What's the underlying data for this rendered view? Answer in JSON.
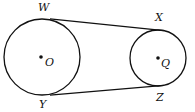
{
  "diagram": {
    "type": "geometry",
    "circles": [
      {
        "id": "circle-o",
        "center_label": "O",
        "cx": 42,
        "cy": 57,
        "r": 38
      },
      {
        "id": "circle-q",
        "center_label": "Q",
        "cx": 158,
        "cy": 58,
        "r": 28
      }
    ],
    "tangents": [
      {
        "id": "tangent-wx",
        "from": "W",
        "to": "X",
        "x1": 50,
        "y1": 18.8,
        "x2": 164,
        "y2": 30.6
      },
      {
        "id": "tangent-yz",
        "from": "Y",
        "to": "Z",
        "x1": 50,
        "y1": 95.2,
        "x2": 164,
        "y2": 85.4
      }
    ],
    "labels": {
      "W": {
        "text": "W",
        "x": 38,
        "y": 11
      },
      "X": {
        "text": "X",
        "x": 155,
        "y": 21
      },
      "O": {
        "text": "O",
        "x": 45,
        "y": 66
      },
      "Q": {
        "text": "Q",
        "x": 161,
        "y": 67
      },
      "Y": {
        "text": "Y",
        "x": 39,
        "y": 108
      },
      "Z": {
        "text": "Z",
        "x": 156,
        "y": 101
      }
    },
    "colors": {
      "stroke": "#111111",
      "background": "#ffffff"
    }
  }
}
